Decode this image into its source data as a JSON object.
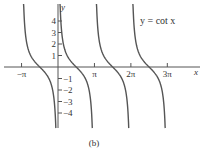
{
  "chart_data": {
    "type": "line",
    "title": "y = cot x",
    "function": "cot",
    "xlabel": "x",
    "ylabel": "y",
    "xlim": [
      -3.6,
      9.9
    ],
    "ylim": [
      -5,
      5
    ],
    "x_ticks": [
      {
        "value": -3.14159,
        "label": "−π"
      },
      {
        "value": 3.14159,
        "label": "π"
      },
      {
        "value": 6.28319,
        "label": "2π"
      },
      {
        "value": 9.42478,
        "label": "3π"
      }
    ],
    "y_ticks": [
      {
        "value": 4,
        "label": "4"
      },
      {
        "value": 3,
        "label": "3"
      },
      {
        "value": 2,
        "label": "2"
      },
      {
        "value": 1,
        "label": "1"
      },
      {
        "value": -1,
        "label": "−1"
      },
      {
        "value": -2,
        "label": "−2"
      },
      {
        "value": -3,
        "label": "−3"
      },
      {
        "value": -4,
        "label": "−4"
      }
    ],
    "branches": [
      {
        "from": -3.14159,
        "to": 0
      },
      {
        "from": 0,
        "to": 3.14159
      },
      {
        "from": 3.14159,
        "to": 6.28319
      },
      {
        "from": 6.28319,
        "to": 9.42478
      }
    ],
    "grid": false,
    "legend": "none",
    "caption": "(b)",
    "line_color": "#555555"
  }
}
